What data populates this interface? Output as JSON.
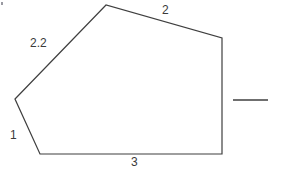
{
  "figure": {
    "kind": "polygon-with-side-labels",
    "background_color": "#ffffff",
    "stroke_color": "#3f3f3f",
    "stroke_width": 1.2,
    "canvas": {
      "width": 281,
      "height": 174
    },
    "polygon": {
      "name": "irregular-pentagon",
      "closed": true,
      "points": "15,99 106,5 222,38 222,154 40,154",
      "vertices": [
        {
          "name": "left-vertex",
          "x": 15,
          "y": 99
        },
        {
          "name": "top-apex-vertex",
          "x": 106,
          "y": 5
        },
        {
          "name": "top-right-vertex",
          "x": 222,
          "y": 38
        },
        {
          "name": "bottom-right-vertex",
          "x": 222,
          "y": 154
        },
        {
          "name": "bottom-left-vertex",
          "x": 40,
          "y": 154
        }
      ]
    },
    "side_labels": [
      {
        "id": "upper-left-side",
        "text": "2.2",
        "x": 30,
        "y": 37
      },
      {
        "id": "upper-right-side",
        "text": "2",
        "x": 162,
        "y": 4
      },
      {
        "id": "lower-left-side",
        "text": "1",
        "x": 10,
        "y": 129
      },
      {
        "id": "bottom-side",
        "text": "3",
        "x": 131,
        "y": 156
      }
    ],
    "reference_segment": {
      "id": "right-rule-segment",
      "x1": 233,
      "y1": 100,
      "x2": 268,
      "y2": 100
    },
    "corner_mark": {
      "x": 1,
      "y": 2,
      "width": 2,
      "height": 3,
      "color": "#9a9aa2"
    }
  }
}
